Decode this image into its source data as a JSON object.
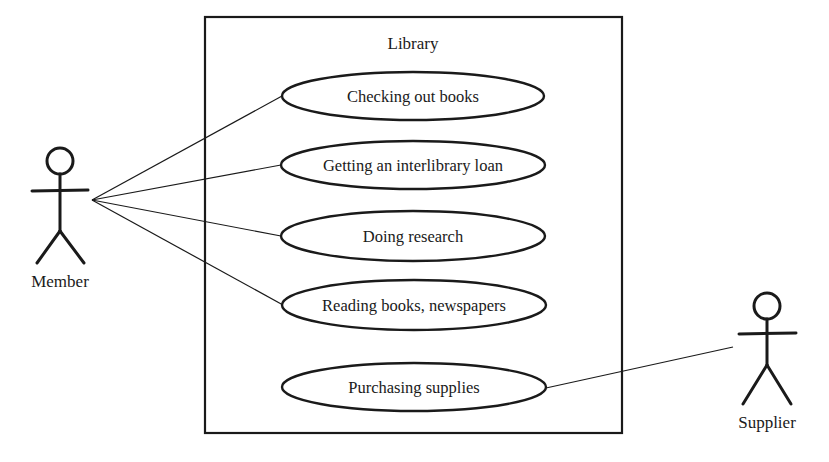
{
  "diagram": {
    "type": "UML use case diagram",
    "system": {
      "title": "Library",
      "box": {
        "x": 205,
        "y": 17,
        "width": 417,
        "height": 416
      }
    },
    "use_cases": [
      {
        "id": "uc1",
        "label": "Checking out books",
        "cx": 413,
        "cy": 96,
        "rx": 131,
        "ry": 24
      },
      {
        "id": "uc2",
        "label": "Getting an interlibrary loan",
        "cx": 413,
        "cy": 165,
        "rx": 132,
        "ry": 24
      },
      {
        "id": "uc3",
        "label": "Doing research",
        "cx": 413,
        "cy": 236,
        "rx": 132,
        "ry": 25
      },
      {
        "id": "uc4",
        "label": "Reading books, newspapers",
        "cx": 414,
        "cy": 305,
        "rx": 132,
        "ry": 25
      },
      {
        "id": "uc5",
        "label": "Purchasing supplies",
        "cx": 414,
        "cy": 387,
        "rx": 132,
        "ry": 24
      }
    ],
    "actors": [
      {
        "id": "member",
        "label": "Member",
        "cx": 60,
        "head_cy": 161
      },
      {
        "id": "supplier",
        "label": "Supplier",
        "cx": 767,
        "head_cy": 306
      }
    ],
    "associations": [
      {
        "actor": "member",
        "use_case": "uc1"
      },
      {
        "actor": "member",
        "use_case": "uc2"
      },
      {
        "actor": "member",
        "use_case": "uc3"
      },
      {
        "actor": "member",
        "use_case": "uc4"
      },
      {
        "actor": "supplier",
        "use_case": "uc5"
      }
    ],
    "colors": {
      "line": "#1a1a1a",
      "background": "#ffffff"
    }
  }
}
